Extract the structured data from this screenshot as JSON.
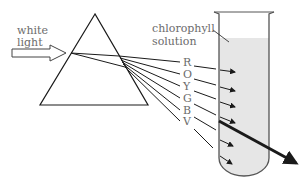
{
  "labels": {
    "light_line1": "white",
    "light_line2": "light",
    "solution_line1": "chlorophyll",
    "solution_line2": "solution"
  },
  "spectrum": [
    "R",
    "O",
    "Y",
    "G",
    "B",
    "V"
  ],
  "colors": {
    "stroke": "#1a1a1a",
    "text": "#6b6b6b",
    "solution": "#e6e6e6",
    "tube_wall": "#555555"
  }
}
